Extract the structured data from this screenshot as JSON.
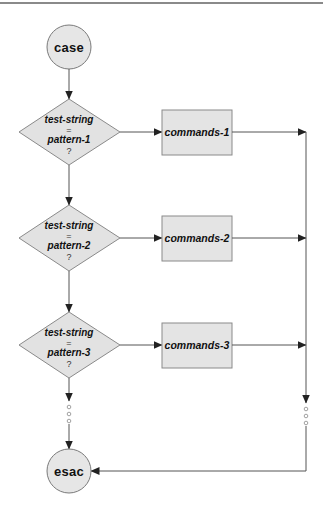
{
  "diagram": {
    "type": "flowchart",
    "colors": {
      "node_fill": "#e4e4e4",
      "node_stroke": "#8a8a8a",
      "edge": "#555555",
      "text": "#111111",
      "top_rule": "#8a8a8a"
    },
    "start": {
      "label": "case"
    },
    "end": {
      "label": "esac"
    },
    "branches": [
      {
        "decision": {
          "line1": "test-string",
          "op": "=",
          "line2": "pattern-1",
          "q": "?"
        },
        "action": {
          "label": "commands-1"
        }
      },
      {
        "decision": {
          "line1": "test-string",
          "op": "=",
          "line2": "pattern-2",
          "q": "?"
        },
        "action": {
          "label": "commands-2"
        }
      },
      {
        "decision": {
          "line1": "test-string",
          "op": "=",
          "line2": "pattern-3",
          "q": "?"
        },
        "action": {
          "label": "commands-3"
        }
      }
    ],
    "continuation": "ellipsis (three small circles) indicating more patterns"
  }
}
